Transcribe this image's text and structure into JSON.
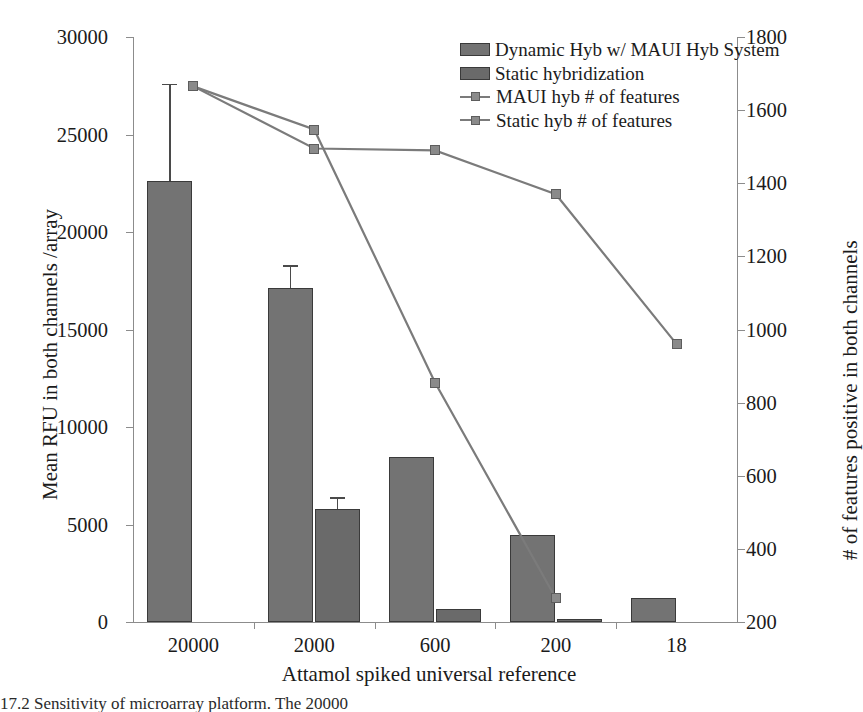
{
  "chart_data": {
    "type": "bar",
    "title": "",
    "xlabel": "Attamol spiked universal reference",
    "ylabel": "Mean RFU in both channels /array",
    "y2label": "# of features positive in both channels",
    "categories": [
      "20000",
      "2000",
      "600",
      "200",
      "18"
    ],
    "ylim": [
      0,
      30000
    ],
    "y2lim": [
      200,
      1800
    ],
    "yticks": [
      "0",
      "5000",
      "10000",
      "15000",
      "20000",
      "25000",
      "30000"
    ],
    "y2ticks": [
      "200",
      "400",
      "600",
      "800",
      "1000",
      "1200",
      "1400",
      "1600",
      "1800"
    ],
    "grid": false,
    "legend_position": "top-right",
    "series": [
      {
        "name": "Dynamic Hyb w/ MAUI Hyb System",
        "type": "bar",
        "axis": "left",
        "color": "#737373",
        "values": [
          22600,
          17150,
          8450,
          4450,
          1250
        ],
        "errors": [
          5000,
          1150,
          0,
          0,
          0
        ]
      },
      {
        "name": "Static hybridization",
        "type": "bar",
        "axis": "left",
        "color": "#6a6a6a",
        "values": [
          0,
          5800,
          650,
          130,
          0
        ],
        "errors": [
          0,
          600,
          0,
          0,
          0
        ]
      },
      {
        "name": "MAUI hyb # of features",
        "type": "line",
        "axis": "right",
        "color": "#7b7b7b",
        "values": [
          1665,
          1495,
          1490,
          1370,
          960
        ]
      },
      {
        "name": "Static hyb # of features",
        "type": "line",
        "axis": "right",
        "color": "#7b7b7b",
        "values": [
          1665,
          1547,
          855,
          265,
          null
        ]
      }
    ]
  },
  "legend": {
    "items": [
      {
        "label": "Dynamic Hyb w/ MAUI Hyb System",
        "marker": "swatch-dynamic"
      },
      {
        "label": "Static hybridization",
        "marker": "swatch-static"
      },
      {
        "label": "MAUI hyb # of features",
        "marker": "line-square"
      },
      {
        "label": "Static hyb # of features",
        "marker": "line-square"
      }
    ]
  },
  "caption": {
    "text": "17.2   Sensitivity of microarray platform.  The 20000"
  }
}
